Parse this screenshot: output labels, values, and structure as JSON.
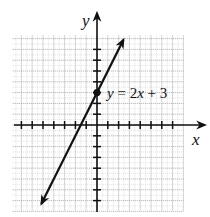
{
  "chart_data": {
    "type": "line",
    "title": "",
    "xlabel": "x",
    "ylabel": "y",
    "xlim": [
      -7.8,
      8
    ],
    "ylim": [
      -8,
      8.3
    ],
    "grid": true,
    "tick_labels_shown": false,
    "x_ticks": [
      -7,
      -6,
      -5,
      -4,
      -3,
      -2,
      -1,
      1,
      2,
      3,
      4,
      5,
      6,
      7
    ],
    "y_ticks": [
      -7,
      -6,
      -5,
      -4,
      -3,
      -2,
      -1,
      1,
      2,
      3,
      4,
      5,
      6,
      7
    ],
    "series": [
      {
        "name": "y = 2x + 3",
        "equation": "y = 2x + 3",
        "slope": 2,
        "intercept": 3,
        "x": [
          -5.1,
          2.4
        ],
        "y": [
          -7.2,
          7.8
        ],
        "arrows_both_ends": true
      }
    ],
    "points": [
      {
        "label": "y-intercept",
        "x": 0,
        "y": 3
      }
    ],
    "annotations": [
      {
        "text": "y = 2x + 3",
        "x": 0.9,
        "y": 2.6
      }
    ]
  },
  "labels": {
    "x_axis": "x",
    "y_axis": "y",
    "equation_parts": {
      "var_y": "y",
      "equals": " = 2",
      "var_x": "x",
      "rest": " + 3"
    }
  },
  "colors": {
    "grid": "#9a9a9a",
    "axis": "#111111",
    "line": "#111111",
    "background": "#ffffff"
  }
}
